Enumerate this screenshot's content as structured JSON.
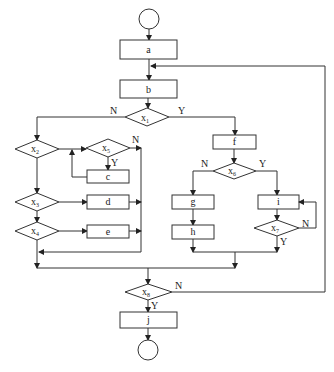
{
  "diagram": {
    "type": "flowchart",
    "nodes": {
      "start": "",
      "a": "a",
      "b": "b",
      "x1": {
        "label": "x",
        "sub": "1"
      },
      "x2": {
        "label": "x",
        "sub": "2"
      },
      "x3": {
        "label": "x",
        "sub": "3"
      },
      "x4": {
        "label": "x",
        "sub": "4"
      },
      "x5": {
        "label": "x",
        "sub": "5"
      },
      "x6": {
        "label": "x",
        "sub": "6"
      },
      "x7": {
        "label": "x",
        "sub": "7"
      },
      "x8": {
        "label": "x",
        "sub": "8"
      },
      "c": "c",
      "d": "d",
      "e": "e",
      "f": "f",
      "g": "g",
      "h": "h",
      "i": "i",
      "j": "j",
      "end": ""
    },
    "edge_labels": {
      "x1_no": "N",
      "x1_yes": "Y",
      "x5_no": "N",
      "x5_yes": "Y",
      "x6_no": "N",
      "x6_yes": "Y",
      "x7_no": "N",
      "x7_yes": "Y",
      "x8_no": "N",
      "x8_yes": "Y"
    }
  }
}
